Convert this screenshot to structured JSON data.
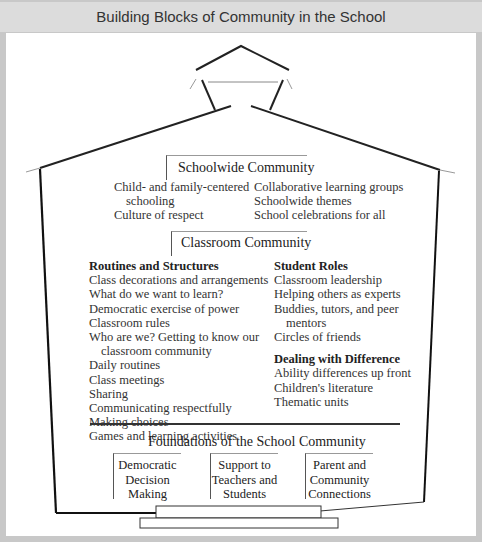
{
  "title": "Building Blocks of Community in the School",
  "schoolwide": {
    "heading": "Schoolwide Community",
    "left_items": [
      "Child- and family-centered",
      "schooling",
      "Culture of respect"
    ],
    "right_items": [
      "Collaborative learning groups",
      "Schoolwide themes",
      "School celebrations for all"
    ]
  },
  "classroom": {
    "heading": "Classroom Community",
    "routines": {
      "heading": "Routines and Structures",
      "items": [
        "Class decorations and arrangements",
        "What do we want to learn?",
        "Democratic exercise of power",
        "Classroom rules",
        "Who are we? Getting to know our",
        "classroom community",
        "Daily routines",
        "Class meetings",
        "Sharing",
        "Communicating respectfully",
        "Making choices",
        "Games and learning activities"
      ]
    },
    "student_roles": {
      "heading": "Student Roles",
      "items": [
        "Classroom leadership",
        "Helping others as experts",
        "Buddies, tutors, and peer",
        "mentors",
        "Circles of friends"
      ]
    },
    "difference": {
      "heading": "Dealing with Difference",
      "items": [
        "Ability differences up front",
        "Children's literature",
        "Thematic units"
      ]
    }
  },
  "foundations": {
    "heading": "Foundations of the School Community",
    "boxes": [
      {
        "lines": [
          "Democratic",
          "Decision",
          "Making"
        ]
      },
      {
        "lines": [
          "Support to",
          "Teachers and",
          "Students"
        ]
      },
      {
        "lines": [
          "Parent and",
          "Community",
          "Connections"
        ]
      }
    ]
  }
}
